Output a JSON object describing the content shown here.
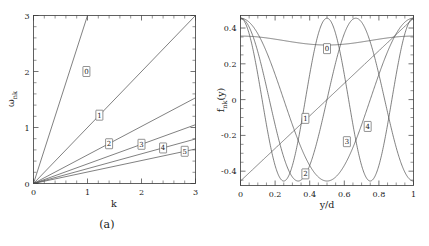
{
  "figure": {
    "panel_a_caption": "(a)",
    "panel_b_caption": "(b)"
  },
  "chart_data": [
    {
      "type": "line",
      "panel": "a",
      "title": "",
      "xlabel": "k",
      "ylabel": "ω",
      "ylabel_sub": "nk",
      "xlim": [
        0,
        3
      ],
      "ylim": [
        0,
        3
      ],
      "xticks": [
        0,
        1,
        2,
        3
      ],
      "xtick_labels": [
        "0",
        "1",
        "2",
        "3"
      ],
      "yticks": [
        0,
        1,
        2,
        3
      ],
      "ytick_labels": [
        "0",
        "1",
        "2",
        "3"
      ],
      "grid": false,
      "legend": "inline-boxed-labels",
      "series": [
        {
          "name": "0",
          "slope": 3.0,
          "label_x": 0.98,
          "label_y": 2.0,
          "values_x": [
            0,
            3
          ],
          "values_y": [
            0,
            9.0
          ]
        },
        {
          "name": "1",
          "slope": 1.0,
          "label_x": 1.22,
          "label_y": 1.22,
          "values_x": [
            0,
            3
          ],
          "values_y": [
            0,
            3.0
          ]
        },
        {
          "name": "2",
          "slope": 0.51,
          "label_x": 1.4,
          "label_y": 0.71,
          "values_x": [
            0,
            3
          ],
          "values_y": [
            0,
            1.53
          ]
        },
        {
          "name": "3",
          "slope": 0.35,
          "label_x": 2.0,
          "label_y": 0.7,
          "values_x": [
            0,
            3
          ],
          "values_y": [
            0,
            1.05
          ]
        },
        {
          "name": "4",
          "slope": 0.265,
          "label_x": 2.4,
          "label_y": 0.635,
          "values_x": [
            0,
            3
          ],
          "values_y": [
            0,
            0.795
          ]
        },
        {
          "name": "5",
          "slope": 0.205,
          "label_x": 2.8,
          "label_y": 0.575,
          "values_x": [
            0,
            3
          ],
          "values_y": [
            0,
            0.615
          ]
        }
      ]
    },
    {
      "type": "line",
      "panel": "b",
      "title": "",
      "xlabel": "y/d",
      "ylabel": "f",
      "ylabel_sub": "nk",
      "ylabel_arg": "(y)",
      "xlim": [
        0,
        1
      ],
      "ylim": [
        -0.48,
        0.47
      ],
      "xticks": [
        0,
        0.2,
        0.4,
        0.6,
        0.8,
        1
      ],
      "xtick_labels": [
        "0",
        "0.2",
        "0.4",
        "0.6",
        "0.8",
        "1"
      ],
      "yticks": [
        -0.4,
        -0.2,
        0,
        0.2,
        0.4
      ],
      "ytick_labels": [
        "-0.4",
        "-0.2",
        "0",
        "0.2",
        "0.4"
      ],
      "grid": false,
      "legend": "inline-boxed-labels",
      "series": [
        {
          "name": "0",
          "mode": 0,
          "shape": "shallow-u",
          "amp": 0.05,
          "offset": 0.305,
          "label_x": 0.5,
          "label_y": 0.285
        },
        {
          "name": "1",
          "mode": 1,
          "shape": "monotonic",
          "amp": 0.455,
          "offset": 0.0,
          "label_x": 0.375,
          "label_y": -0.105
        },
        {
          "name": "2",
          "mode": 2,
          "shape": "cosine",
          "amp": 0.455,
          "offset": 0.0,
          "label_x": 0.375,
          "label_y": -0.415
        },
        {
          "name": "3",
          "mode": 3,
          "shape": "cosine",
          "amp": 0.455,
          "offset": 0.0,
          "label_x": 0.615,
          "label_y": -0.235
        },
        {
          "name": "4",
          "mode": 4,
          "shape": "cosine",
          "amp": 0.455,
          "offset": 0.0,
          "label_x": 0.735,
          "label_y": -0.15
        }
      ]
    }
  ]
}
